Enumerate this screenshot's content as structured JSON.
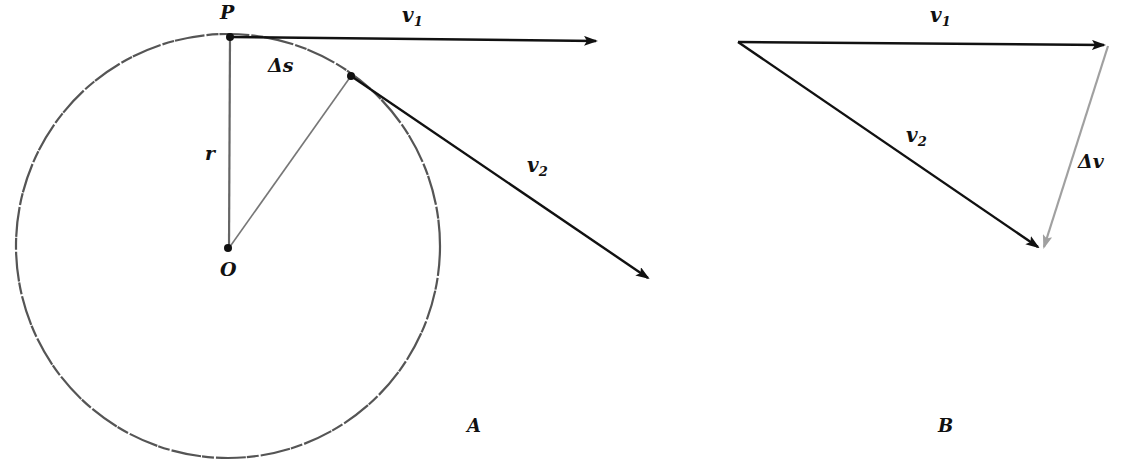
{
  "diagram": {
    "panel_a": {
      "label": "A",
      "point_p_label": "P",
      "center_label": "O",
      "radius_label": "r",
      "arc_label": "Δs",
      "v1_label": "v",
      "v1_sub": "1",
      "v2_label": "v",
      "v2_sub": "2"
    },
    "panel_b": {
      "label": "B",
      "v1_label": "v",
      "v1_sub": "1",
      "v2_label": "v",
      "v2_sub": "2",
      "dv_label": "Δv"
    },
    "colors": {
      "ink": "#111111",
      "circle": "#555555",
      "delta_v": "#a0a0a0"
    }
  }
}
